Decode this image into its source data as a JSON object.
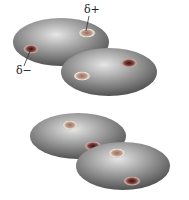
{
  "diagram": {
    "labels": {
      "delta_plus": "δ+",
      "delta_minus": "δ−"
    },
    "colors": {
      "shading_light": "#d8d8d8",
      "shading_dark": "#4a4a4a",
      "ring": "#e8e0d0",
      "spot": "#7a3030"
    },
    "molecules": [
      {
        "id": 1,
        "cx": 61,
        "cy": 42,
        "rx": 48,
        "ry": 24
      },
      {
        "id": 2,
        "cx": 109,
        "cy": 72,
        "rx": 48,
        "ry": 24
      },
      {
        "id": 3,
        "cx": 78,
        "cy": 136,
        "rx": 48,
        "ry": 23
      },
      {
        "id": 4,
        "cx": 123,
        "cy": 166,
        "rx": 47,
        "ry": 24
      }
    ]
  }
}
